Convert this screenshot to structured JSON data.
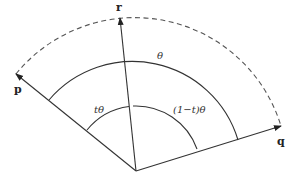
{
  "diagram": {
    "type": "slerp-interpolation",
    "origin": [
      136,
      171
    ],
    "vectors": [
      {
        "id": "p",
        "label": "p",
        "tip": [
          16,
          74
        ]
      },
      {
        "id": "r",
        "label": "r",
        "tip": [
          120,
          18
        ]
      },
      {
        "id": "q",
        "label": "q",
        "tip": [
          281,
          126
        ]
      }
    ],
    "arcs": {
      "outer_dashed": {
        "radius": 153,
        "from": "p",
        "to": "q"
      },
      "theta": {
        "radius": 110,
        "from": "p",
        "to": "q",
        "label": "θ"
      },
      "t_theta": {
        "radius": 65,
        "from": "p",
        "to": "r",
        "label": "tθ"
      },
      "one_minus_t_theta": {
        "radius": 65,
        "from": "r",
        "to": "q",
        "label": "(1−t)θ"
      }
    },
    "colors": {
      "line": "#333333",
      "dashed": "#555555"
    }
  }
}
